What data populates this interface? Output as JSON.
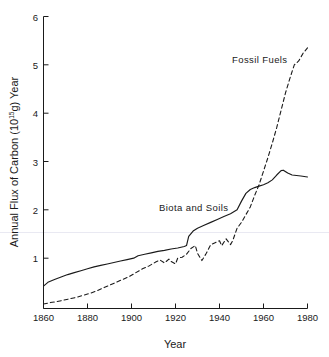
{
  "chart_data": {
    "type": "line",
    "title": "",
    "xlabel": "Year",
    "ylabel": "Annual Flux of Carbon (10",
    "ylabel_sup": "15",
    "ylabel_tail": "g) Year",
    "xlim": [
      1860,
      1980
    ],
    "ylim": [
      0,
      6
    ],
    "xticks": [
      1860,
      1880,
      1900,
      1920,
      1940,
      1960,
      1980
    ],
    "xtick_labels": [
      "1860",
      "1880",
      "1900",
      "1920",
      "1940",
      "1960",
      "1980"
    ],
    "yticks": [
      1,
      2,
      3,
      4,
      5,
      6
    ],
    "ytick_labels": [
      "1",
      "2",
      "3",
      "4",
      "5",
      "6"
    ],
    "grid": false,
    "legend_position": "inline-annotations",
    "annotations": [
      {
        "text": "Fossil Fuels",
        "x": 1960,
        "y": 5.45
      },
      {
        "text": "Biota and Soils",
        "x": 1923,
        "y": 2.15
      }
    ],
    "series": [
      {
        "name": "Biota and Soils",
        "style": "solid",
        "color": "#1a1a1a",
        "x": [
          1860,
          1862,
          1865,
          1868,
          1871,
          1874,
          1877,
          1880,
          1883,
          1886,
          1889,
          1892,
          1895,
          1898,
          1901,
          1903,
          1906,
          1909,
          1912,
          1915,
          1918,
          1921,
          1924,
          1925,
          1926,
          1928,
          1930,
          1933,
          1936,
          1939,
          1942,
          1945,
          1948,
          1950,
          1952,
          1954,
          1956,
          1958,
          1960,
          1962,
          1964,
          1966,
          1968,
          1969,
          1971,
          1973,
          1975,
          1977,
          1980
        ],
        "y": [
          0.42,
          0.5,
          0.56,
          0.61,
          0.66,
          0.7,
          0.74,
          0.78,
          0.82,
          0.85,
          0.88,
          0.91,
          0.94,
          0.97,
          1.0,
          1.05,
          1.08,
          1.11,
          1.14,
          1.16,
          1.19,
          1.21,
          1.24,
          1.26,
          1.45,
          1.56,
          1.62,
          1.68,
          1.74,
          1.8,
          1.86,
          1.92,
          2.0,
          2.18,
          2.34,
          2.42,
          2.46,
          2.49,
          2.52,
          2.56,
          2.62,
          2.72,
          2.81,
          2.82,
          2.76,
          2.72,
          2.71,
          2.7,
          2.68
        ]
      },
      {
        "name": "Fossil Fuels",
        "style": "dashed",
        "color": "#1a1a1a",
        "x": [
          1860,
          1863,
          1866,
          1869,
          1872,
          1875,
          1878,
          1881,
          1884,
          1887,
          1890,
          1893,
          1896,
          1899,
          1902,
          1905,
          1908,
          1911,
          1913,
          1915,
          1917,
          1918,
          1920,
          1921,
          1923,
          1925,
          1927,
          1929,
          1930,
          1932,
          1934,
          1936,
          1938,
          1940,
          1941,
          1943,
          1945,
          1946,
          1948,
          1950,
          1952,
          1954,
          1956,
          1958,
          1960,
          1962,
          1964,
          1966,
          1968,
          1970,
          1972,
          1974,
          1976,
          1978,
          1980
        ],
        "y": [
          0.05,
          0.08,
          0.1,
          0.13,
          0.16,
          0.19,
          0.23,
          0.27,
          0.32,
          0.38,
          0.44,
          0.5,
          0.56,
          0.62,
          0.7,
          0.78,
          0.84,
          0.92,
          0.96,
          0.9,
          0.98,
          0.93,
          0.88,
          1.0,
          1.02,
          1.08,
          1.2,
          1.26,
          1.1,
          0.95,
          1.1,
          1.28,
          1.32,
          1.36,
          1.26,
          1.4,
          1.28,
          1.36,
          1.62,
          1.74,
          1.9,
          2.06,
          2.3,
          2.52,
          2.8,
          3.08,
          3.38,
          3.7,
          4.06,
          4.42,
          4.72,
          5.0,
          5.08,
          5.24,
          5.35
        ]
      }
    ]
  },
  "axis": {
    "y_title_text": "Annual Flux of Carbon (10",
    "y_title_sup": "15",
    "y_title_end": "g) Year",
    "x_title": "Year"
  }
}
